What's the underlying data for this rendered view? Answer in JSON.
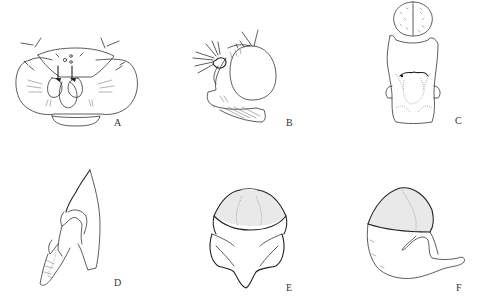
{
  "figure": {
    "type": "morphology-plate",
    "panels": [
      {
        "id": "A",
        "label": "A",
        "description": "head, frontal view"
      },
      {
        "id": "B",
        "label": "B",
        "description": "head, lateral view"
      },
      {
        "id": "C",
        "label": "C",
        "description": "dorsal structure"
      },
      {
        "id": "D",
        "label": "D",
        "description": "genitalia, lateral view"
      },
      {
        "id": "E",
        "label": "E",
        "description": "structure, ventral view"
      },
      {
        "id": "F",
        "label": "F",
        "description": "structure, lateral view"
      }
    ]
  },
  "colors": {
    "ink": "#333333",
    "background": "#ffffff"
  }
}
